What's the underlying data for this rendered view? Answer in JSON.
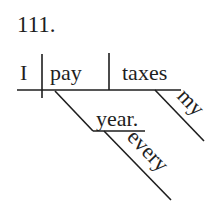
{
  "problem_number": "111.",
  "sentence": "I pay taxes every year.",
  "diagram": {
    "subject": "I",
    "verb": "pay",
    "direct_object": "taxes",
    "modifiers": [
      {
        "word": "year.",
        "modifies": "pay",
        "type": "adverbial noun"
      },
      {
        "word": "every",
        "modifies": "year.",
        "type": "adjective"
      },
      {
        "word": "my",
        "modifies": "taxes",
        "type": "possessive"
      }
    ]
  },
  "labels": {
    "subject": "I",
    "verb": "pay",
    "object": "taxes",
    "year": "year.",
    "every": "every",
    "my": "my"
  },
  "colors": {
    "ink": "#1e1e1e",
    "background": "#ffffff"
  }
}
